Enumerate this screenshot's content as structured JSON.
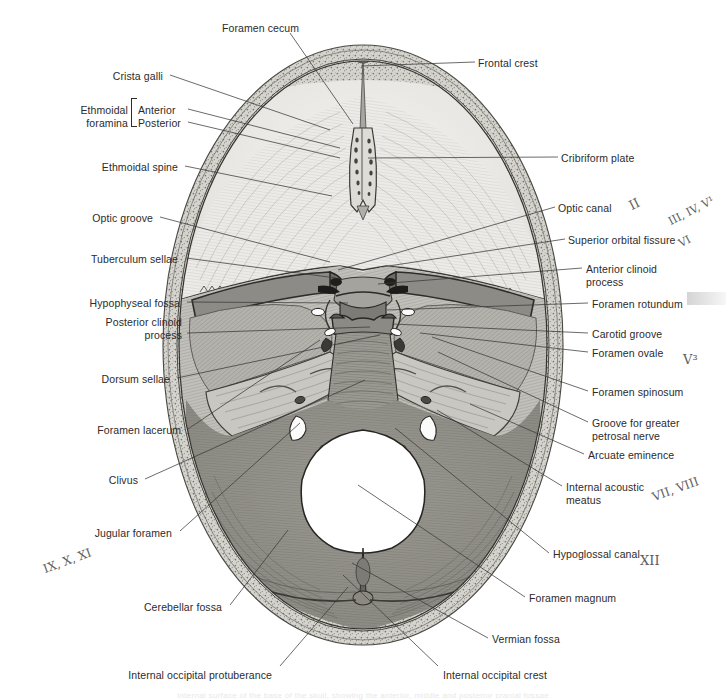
{
  "figure": {
    "bottom_caption": "Internal surface of the base of the skull, showing the anterior, middle and posterior cranial fossae"
  },
  "colors": {
    "text": "#2b2b2b",
    "leader": "#3a3a3a",
    "handwriting": "#5e5e5e",
    "background": "#ffffff",
    "anterior_fossa": "#e9e9e6",
    "middle_fossa": "#b9b9b4",
    "posterior_fossa": "#8e8e89",
    "diploe": "#c9c9c4",
    "foramen_magnum": "#ffffff"
  },
  "labels_left": [
    {
      "id": "crista-galli",
      "text": "Crista galli",
      "x": 163,
      "y": 70,
      "anchor": "right",
      "lead": [
        170,
        75,
        330,
        130
      ]
    },
    {
      "id": "ethmoidal-foramina",
      "text": "Ethmoidal\nforamina",
      "x": 128,
      "y": 104,
      "anchor": "right",
      "lead": null
    },
    {
      "id": "ethmoidal-foramina-anterior",
      "text": "Anterior",
      "x": 138,
      "y": 104,
      "anchor": "left",
      "lead": [
        188,
        109,
        340,
        148
      ]
    },
    {
      "id": "ethmoidal-foramina-posterior",
      "text": "Posterior",
      "x": 138,
      "y": 117,
      "anchor": "left",
      "lead": [
        188,
        122,
        340,
        158
      ]
    },
    {
      "id": "ethmoidal-spine",
      "text": "Ethmoidal spine",
      "x": 178,
      "y": 161,
      "anchor": "right",
      "lead": [
        185,
        166,
        332,
        196
      ]
    },
    {
      "id": "optic-groove",
      "text": "Optic groove",
      "x": 153,
      "y": 212,
      "anchor": "right",
      "lead": [
        160,
        217,
        330,
        262
      ]
    },
    {
      "id": "tuberculum-sellae",
      "text": "Tuberculum sellae",
      "x": 178,
      "y": 253,
      "anchor": "right",
      "lead": [
        186,
        258,
        336,
        278
      ]
    },
    {
      "id": "hypophyseal-fossa",
      "text": "Hypophyseal fossa",
      "x": 180,
      "y": 297,
      "anchor": "right",
      "lead": [
        187,
        302,
        348,
        303
      ]
    },
    {
      "id": "posterior-clinoid-process",
      "text": "Posterior clinoid\nprocess",
      "x": 182,
      "y": 316,
      "anchor": "right",
      "lead": [
        187,
        333,
        370,
        327
      ]
    },
    {
      "id": "dorsum-sellae",
      "text": "Dorsum sellae",
      "x": 170,
      "y": 373,
      "anchor": "right",
      "lead": [
        177,
        378,
        380,
        335
      ]
    },
    {
      "id": "foramen-lacerum",
      "text": "Foramen lacerum",
      "x": 181,
      "y": 424,
      "anchor": "right",
      "lead": [
        188,
        429,
        320,
        340
      ]
    },
    {
      "id": "clivus",
      "text": "Clivus",
      "x": 138,
      "y": 474,
      "anchor": "right",
      "lead": [
        145,
        479,
        365,
        380
      ]
    },
    {
      "id": "jugular-foramen",
      "text": "Jugular foramen",
      "x": 172,
      "y": 527,
      "anchor": "right",
      "lead": [
        180,
        531,
        300,
        423
      ]
    },
    {
      "id": "cerebellar-fossa",
      "text": "Cerebellar fossa",
      "x": 222,
      "y": 601,
      "anchor": "right",
      "lead": [
        230,
        605,
        288,
        530
      ]
    },
    {
      "id": "internal-occipital-protuberance",
      "text": "Internal occipital protuberance",
      "x": 272,
      "y": 669,
      "anchor": "right",
      "lead": [
        280,
        666,
        348,
        587
      ]
    }
  ],
  "labels_right": [
    {
      "id": "frontal-crest",
      "text": "Frontal crest",
      "x": 478,
      "y": 57,
      "anchor": "left",
      "lead": [
        361,
        66,
        475,
        62
      ]
    },
    {
      "id": "cribriform-plate",
      "text": "Cribriform plate",
      "x": 561,
      "y": 152,
      "anchor": "left",
      "lead": [
        368,
        158,
        558,
        157
      ]
    },
    {
      "id": "optic-canal",
      "text": "Optic canal",
      "x": 558,
      "y": 202,
      "anchor": "left",
      "lead": [
        338,
        270,
        555,
        207
      ]
    },
    {
      "id": "superior-orbital-fissure",
      "text": "Superior orbital fissure",
      "x": 568,
      "y": 234,
      "anchor": "left",
      "lead": [
        382,
        267,
        565,
        239
      ]
    },
    {
      "id": "anterior-clinoid-process",
      "text": "Anterior clinoid\nprocess",
      "x": 586,
      "y": 263,
      "anchor": "left",
      "lead": [
        378,
        284,
        582,
        268
      ]
    },
    {
      "id": "foramen-rotundum",
      "text": "Foramen rotundum",
      "x": 592,
      "y": 298,
      "anchor": "left",
      "lead": [
        387,
        310,
        588,
        303
      ]
    },
    {
      "id": "carotid-groove",
      "text": "Carotid groove",
      "x": 592,
      "y": 328,
      "anchor": "left",
      "lead": [
        393,
        324,
        588,
        333
      ]
    },
    {
      "id": "foramen-ovale",
      "text": "Foramen ovale",
      "x": 592,
      "y": 347,
      "anchor": "left",
      "lead": [
        420,
        333,
        588,
        352
      ]
    },
    {
      "id": "foramen-spinosum",
      "text": "Foramen spinosum",
      "x": 592,
      "y": 386,
      "anchor": "left",
      "lead": [
        432,
        337,
        588,
        391
      ]
    },
    {
      "id": "groove-greater-petrosal-nerve",
      "text": "Groove for greater\npetrosal nerve",
      "x": 592,
      "y": 417,
      "anchor": "left",
      "lead": [
        438,
        352,
        588,
        422
      ]
    },
    {
      "id": "arcuate-eminence",
      "text": "Arcuate eminence",
      "x": 588,
      "y": 449,
      "anchor": "left",
      "lead": [
        470,
        404,
        584,
        454
      ]
    },
    {
      "id": "internal-acoustic-meatus",
      "text": "Internal acoustic\nmeatus",
      "x": 566,
      "y": 481,
      "anchor": "left",
      "lead": [
        437,
        410,
        562,
        486
      ]
    },
    {
      "id": "hypoglossal-canal",
      "text": "Hypoglossal canal",
      "x": 553,
      "y": 548,
      "anchor": "left",
      "lead": [
        395,
        428,
        549,
        553
      ]
    },
    {
      "id": "foramen-magnum",
      "text": "Foramen magnum",
      "x": 529,
      "y": 592,
      "anchor": "left",
      "lead": [
        358,
        485,
        525,
        597
      ]
    },
    {
      "id": "vermian-fossa",
      "text": "Vermian fossa",
      "x": 492,
      "y": 633,
      "anchor": "left",
      "lead": [
        352,
        563,
        488,
        638
      ]
    },
    {
      "id": "internal-occipital-crest",
      "text": "Internal occipital crest",
      "x": 443,
      "y": 669,
      "anchor": "left",
      "lead": [
        343,
        575,
        438,
        666
      ]
    }
  ],
  "labels_top": [
    {
      "id": "foramen-cecum",
      "text": "Foramen cecum",
      "x": 222,
      "y": 22,
      "anchor": "left",
      "lead": [
        290,
        33,
        353,
        124
      ]
    }
  ],
  "handwritten": [
    {
      "id": "cn-ii",
      "text": "II",
      "x": 633,
      "y": 198,
      "size": 13,
      "rotate": "slant"
    },
    {
      "id": "cn-iii-iv-v1-vi",
      "text": "III, IV, V¹",
      "x": 672,
      "y": 215,
      "size": 11,
      "rotate": "slant"
    },
    {
      "id": "cn-vi",
      "text": "VI",
      "x": 682,
      "y": 237,
      "size": 11,
      "rotate": "slant"
    },
    {
      "id": "cn-v3",
      "text": "V³",
      "x": 683,
      "y": 352,
      "size": 13,
      "rotate": "none"
    },
    {
      "id": "cn-vii-viii",
      "text": "VII, VIII",
      "x": 655,
      "y": 490,
      "size": 12,
      "rotate": "slant2"
    },
    {
      "id": "cn-xii",
      "text": "XII",
      "x": 640,
      "y": 553,
      "size": 13,
      "rotate": "none"
    },
    {
      "id": "cn-ix-x-xi",
      "text": "IX, X, XI",
      "x": 46,
      "y": 562,
      "size": 12,
      "rotate": "slant2"
    }
  ],
  "highlight": {
    "id": "foramen-rotundum-highlight",
    "x": 687,
    "y": 292,
    "w": 40,
    "h": 13
  }
}
